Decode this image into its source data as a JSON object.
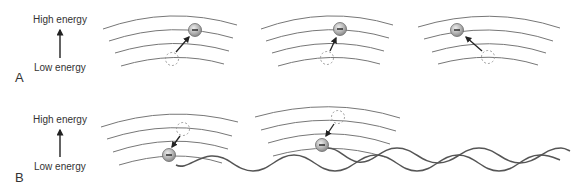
{
  "figure": {
    "panels": [
      {
        "letter": "A",
        "high_label": "High energy",
        "low_label": "Low energy",
        "description": "Electron absorbs energy and moves to a higher energy level",
        "groups": 3
      },
      {
        "letter": "B",
        "high_label": "High energy",
        "low_label": "Low energy",
        "description": "Electron drops to a lower energy level and emits a wave",
        "groups": 2
      }
    ],
    "electron_symbol": "−",
    "colors": {
      "orbit": "#777777",
      "electron_fill": "#b8b8b8",
      "electron_stroke": "#6a6a6a",
      "dashed": "#999999",
      "wave": "#555555",
      "arrow": "#222222",
      "text": "#333333"
    }
  }
}
